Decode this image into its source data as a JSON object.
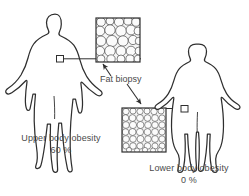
{
  "figure": {
    "type": "medical-illustration"
  },
  "annotations": {
    "fat_biopsy_label": "Fat biopsy"
  },
  "panels": [
    {
      "id": "upper-body",
      "caption": "Upper body obesity",
      "percent": "60 %",
      "biopsy_site": "abdomen",
      "cell_size": "large"
    },
    {
      "id": "lower-body",
      "caption": "Lower body obesity",
      "percent": "0 %",
      "biopsy_site": "hip",
      "cell_size": "small"
    }
  ],
  "colors": {
    "outline": "#2f2f2f",
    "text": "#4a4a4a",
    "cell_stroke": "#4d4d4d",
    "box_fill": "#f2f2f2",
    "background": "#ffffff"
  }
}
